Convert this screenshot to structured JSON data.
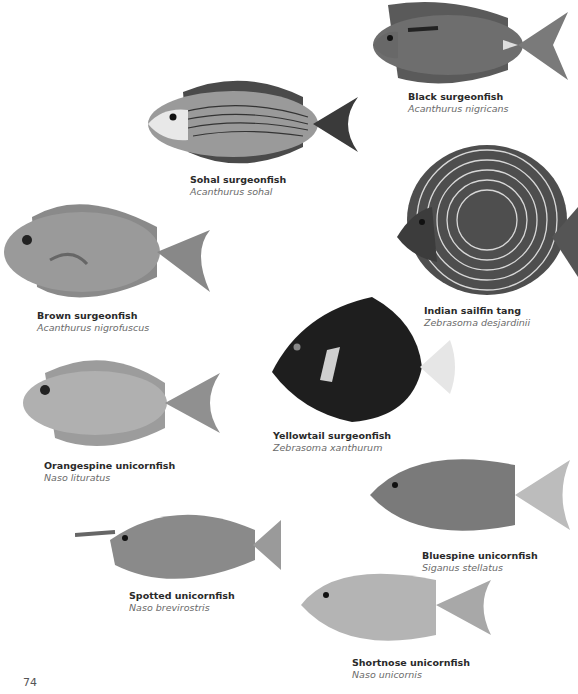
{
  "page": {
    "number": "74"
  },
  "fishes": [
    {
      "id": "black-surgeonfish",
      "common": "Black surgeonfish",
      "latin": "Acanthurus nigricans",
      "tone": "#6e6e6e"
    },
    {
      "id": "sohal-surgeonfish",
      "common": "Sohal surgeonfish",
      "latin": "Acanthurus sohal",
      "tone": "#8c8c8c"
    },
    {
      "id": "brown-surgeonfish",
      "common": "Brown surgeonfish",
      "latin": "Acanthurus nigrofuscus",
      "tone": "#9a9a9a"
    },
    {
      "id": "indian-sailfin-tang",
      "common": "Indian sailfin tang",
      "latin": "Zebrasoma desjardinii",
      "tone": "#555555"
    },
    {
      "id": "yellowtail-surgeonfish",
      "common": "Yellowtail surgeonfish",
      "latin": "Zebrasoma xanthurum",
      "tone": "#1e1e1e"
    },
    {
      "id": "orangespine-unicornfish",
      "common": "Orangespine unicornfish",
      "latin": "Naso lituratus",
      "tone": "#a8a8a8"
    },
    {
      "id": "bluespine-unicornfish",
      "common": "Bluespine unicornfish",
      "latin": "Siganus stellatus",
      "tone": "#7a7a7a"
    },
    {
      "id": "spotted-unicornfish",
      "common": "Spotted unicornfish",
      "latin": "Naso brevirostris",
      "tone": "#8a8a8a"
    },
    {
      "id": "shortnose-unicornfish",
      "common": "Shortnose unicornfish",
      "latin": "Naso unicornis",
      "tone": "#b4b4b4"
    }
  ]
}
